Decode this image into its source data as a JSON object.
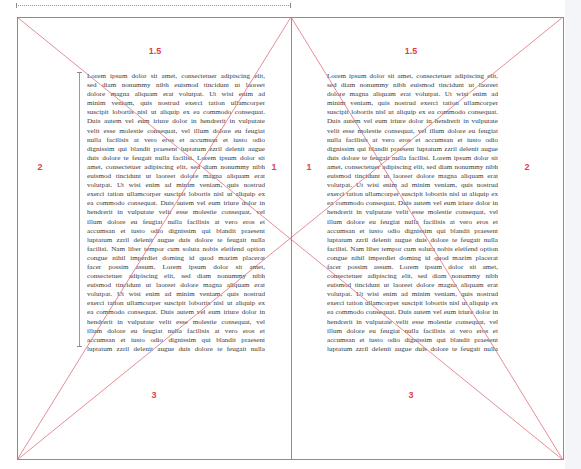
{
  "spread": {
    "colors": {
      "guide_line": "#e0707a",
      "label": "#e0404a",
      "page_border": "#8c8c8c",
      "text": "#3a3a3a"
    },
    "left_page": {
      "labels": {
        "top": "1.5",
        "outer": "2",
        "inner": "1",
        "bottom": "3"
      }
    },
    "right_page": {
      "labels": {
        "top": "1.5",
        "inner": "1",
        "outer": "2",
        "bottom": "3"
      }
    },
    "body_lines": [
      "Lorem ipsum dolor sit amet, consectetuer adipiscing elit,",
      "sed diam nonummy nibh euismod tincidunt ut laoreet",
      "dolore magna aliquam erat volutpat. Ut wisi enim ad",
      "minim veniam, quis nostrud exerci tation ullamcorper",
      "suscipit lobortis nisl ut aliquip ex ea commodo consequat.",
      "Duis autem vel eum iriure dolor in hendrerit in vulputate",
      "velit esse molestie consequat, vel illum dolore eu feugiat",
      "nulla facilisis at vero eros et accumsan et iusto odio",
      "dignissim qui blandit praesent luptatum zzril delenit augue",
      "duis dolore te feugait nulla facilisi. Lorem ipsum dolor sit",
      "amet, consectetuer adipiscing elit, sed diam nonummy nibh",
      "euismod tincidunt ut laoreet dolore magna aliquam erat",
      "volutpat. Ut wisi enim ad minim veniam, quis nostrud",
      "exerci tation ullamcorper suscipit lobortis nisl ut aliquip ex",
      "ea commodo consequat. Duis autem vel eum iriure dolor in",
      "hendrerit in vulputate velit esse molestie consequat, vel",
      "illum dolore eu feugiat nulla facilisis at vero eros et",
      "accumsan et iusto odio dignissim qui blandit praesent",
      "luptatum zzril delenit augue duis dolore te feugait nulla",
      "facilisi. Nam liber tempor cum soluta nobis eleifend option",
      "congue nihil imperdiet doming id quod mazim placerat",
      "facer possim assum. Lorem ipsum dolor sit amet,",
      "consectetuer adipiscing elit, sed diam nonummy nibh",
      "euismod tincidunt ut laoreet dolore magna aliquam erat",
      "volutpat. Ut wisi enim ad minim veniam, quis nostrud",
      "exerci tation ullamcorper suscipit lobortis nisl ut aliquip ex",
      "ea commodo consequat. Duis autem vel eum iriure dolor in",
      "hendrerit in vulputate velit esse molestie consequat, vel",
      "illum dolore eu feugiat nulla facilisis at vero eros et",
      "accumsan et iusto odio dignissim qui blandit praesent",
      "luptatum zzril delenit augue duis dolore te feugait nulla"
    ]
  }
}
